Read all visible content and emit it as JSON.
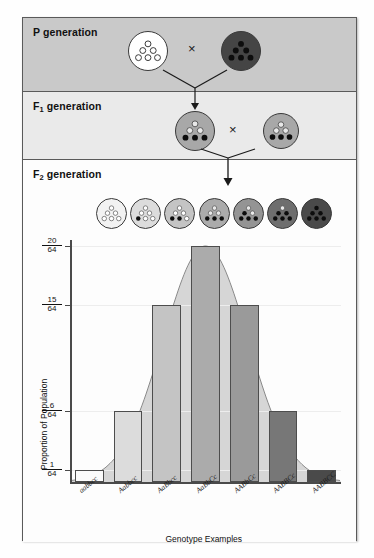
{
  "figure": {
    "panels": [
      {
        "id": "p",
        "label_html": "P generation",
        "label_text": "P generation"
      },
      {
        "id": "f1",
        "label_html": "F1 generation",
        "label_text": "F1 generation"
      },
      {
        "id": "f2",
        "label_html": "F2 generation",
        "label_text": "F2 generation"
      }
    ],
    "cross_symbol": "×"
  },
  "p_generation": {
    "parent_left": {
      "fill": "#ffffff",
      "filled_dots": 0,
      "total_dots": 6,
      "genotype": "aabbcc"
    },
    "parent_right": {
      "fill": "#454545",
      "filled_dots": 6,
      "total_dots": 6,
      "genotype": "AABBCC"
    }
  },
  "f1_generation": {
    "offspring_left": {
      "fill": "#a8a8a8",
      "filled_dots": 3,
      "total_dots": 6,
      "genotype": "AaBbCc"
    },
    "offspring_right": {
      "fill": "#a8a8a8",
      "filled_dots": 3,
      "total_dots": 6,
      "genotype": "AaBbCc"
    }
  },
  "f2_generation": {
    "organisms": [
      {
        "fill": "#f2f2f2",
        "filled_dots": 0,
        "total_dots": 6
      },
      {
        "fill": "#dcdcdc",
        "filled_dots": 1,
        "total_dots": 6
      },
      {
        "fill": "#c4c4c4",
        "filled_dots": 2,
        "total_dots": 6
      },
      {
        "fill": "#ababab",
        "filled_dots": 3,
        "total_dots": 6
      },
      {
        "fill": "#949494",
        "filled_dots": 4,
        "total_dots": 6
      },
      {
        "fill": "#6e6e6e",
        "filled_dots": 5,
        "total_dots": 6
      },
      {
        "fill": "#4a4a4a",
        "filled_dots": 6,
        "total_dots": 6
      }
    ]
  },
  "chart_data": {
    "type": "bar",
    "title": "",
    "xlabel": "Genotype Examples",
    "ylabel": "Proportion of Population",
    "categories": [
      "aabbcc",
      "Aabbcc",
      "AaBbcc",
      "AaBbCc",
      "AABbCc",
      "AABBCc",
      "AABBCC"
    ],
    "values": [
      1,
      6,
      15,
      20,
      15,
      6,
      1
    ],
    "value_labels": [
      "1/64",
      "6/64",
      "15/64",
      "20/64",
      "15/64",
      "6/64",
      "1/64"
    ],
    "denominator": 64,
    "ylim": [
      0,
      20
    ],
    "ytick_values": [
      1,
      6,
      15,
      20
    ],
    "ytick_numerators": [
      "1",
      "6",
      "15",
      "20"
    ],
    "ytick_denominators": [
      "64",
      "64",
      "64",
      "64"
    ],
    "grid": true,
    "legend": "none",
    "overlay_curve": {
      "type": "normal-distribution",
      "description": "bell curve envelope over bars",
      "fill": "#d6d6d6",
      "stroke": "#8a8a8a"
    },
    "bar_colors": [
      "#fbfbfb",
      "#dcdcdc",
      "#c4c4c4",
      "#ababab",
      "#9a9a9a",
      "#777777",
      "#4a4a4a"
    ]
  }
}
